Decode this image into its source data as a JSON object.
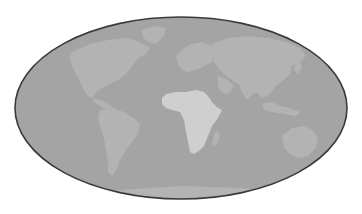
{
  "map": {
    "projection": "mollweide",
    "highlighted_region": "Africa",
    "colors": {
      "background": "#ffffff",
      "ocean": "#a4a4a4",
      "land": "#b3b3b3",
      "highlight": "#cfcfcf",
      "outline": "#3a3a3a"
    },
    "regions": [
      {
        "name": "North America",
        "highlighted": false
      },
      {
        "name": "Greenland",
        "highlighted": false
      },
      {
        "name": "South America",
        "highlighted": false
      },
      {
        "name": "Europe",
        "highlighted": false
      },
      {
        "name": "Africa",
        "highlighted": true
      },
      {
        "name": "Madagascar",
        "highlighted": false
      },
      {
        "name": "Asia",
        "highlighted": false
      },
      {
        "name": "Arabian Peninsula",
        "highlighted": false
      },
      {
        "name": "India",
        "highlighted": false
      },
      {
        "name": "Southeast Asia",
        "highlighted": false
      },
      {
        "name": "Japan",
        "highlighted": false
      },
      {
        "name": "Indonesia",
        "highlighted": false
      },
      {
        "name": "Australia",
        "highlighted": false
      },
      {
        "name": "New Zealand",
        "highlighted": false
      },
      {
        "name": "Antarctica",
        "highlighted": false
      }
    ]
  }
}
